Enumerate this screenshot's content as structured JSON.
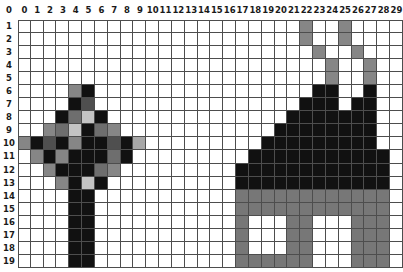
{
  "app": {
    "title": "Pixel Grid Editor",
    "description": "Pixel-art grid showing a tree on the left and a house on the right"
  },
  "grid": {
    "columns": 30,
    "rows": 19,
    "column_labels": [
      "0",
      "1",
      "2",
      "3",
      "4",
      "5",
      "6",
      "7",
      "8",
      "9",
      "10",
      "11",
      "12",
      "13",
      "14",
      "15",
      "16",
      "17",
      "18",
      "19",
      "20",
      "21",
      "22",
      "23",
      "24",
      "25",
      "26",
      "27",
      "28",
      "29"
    ],
    "row_labels": [
      "1",
      "2",
      "3",
      "4",
      "5",
      "6",
      "7",
      "8",
      "9",
      "10",
      "11",
      "12",
      "13",
      "14",
      "15",
      "16",
      "17",
      "18",
      "19"
    ],
    "corner_label": "0",
    "gridline_color": "#4d4d4d",
    "background_color": "#ffffff"
  },
  "palette": {
    "empty": "#ffffff",
    "black": "#111111",
    "dark_gray": "#4f4f4f",
    "mid_gray": "#6e6e6e",
    "gray": "#868686",
    "light_gray": "#a8a8a8",
    "pale_gray": "#c4c4c4",
    "house_body": "#777777",
    "window": "#ffffff"
  },
  "chart_data": {
    "type": "heatmap",
    "xlabel": "column",
    "ylabel": "row",
    "x": [
      "0",
      "1",
      "2",
      "3",
      "4",
      "5",
      "6",
      "7",
      "8",
      "9",
      "10",
      "11",
      "12",
      "13",
      "14",
      "15",
      "16",
      "17",
      "18",
      "19",
      "20",
      "21",
      "22",
      "23",
      "24",
      "25",
      "26",
      "27",
      "28",
      "29"
    ],
    "y": [
      "1",
      "2",
      "3",
      "4",
      "5",
      "6",
      "7",
      "8",
      "9",
      "10",
      "11",
      "12",
      "13",
      "14",
      "15",
      "16",
      "17",
      "18",
      "19"
    ],
    "legend": [
      "empty",
      "black",
      "dark_gray",
      "mid_gray",
      "gray",
      "light_gray",
      "pale_gray",
      "house_body"
    ],
    "cells": [
      [
        "e",
        "e",
        "e",
        "e",
        "e",
        "e",
        "e",
        "e",
        "e",
        "e",
        "e",
        "e",
        "e",
        "e",
        "e",
        "e",
        "e",
        "e",
        "e",
        "e",
        "e",
        "e",
        "g",
        "e",
        "e",
        "g",
        "e",
        "e",
        "e",
        "e"
      ],
      [
        "e",
        "e",
        "e",
        "e",
        "e",
        "e",
        "e",
        "e",
        "e",
        "e",
        "e",
        "e",
        "e",
        "e",
        "e",
        "e",
        "e",
        "e",
        "e",
        "e",
        "e",
        "e",
        "g",
        "e",
        "e",
        "g",
        "e",
        "e",
        "e",
        "e"
      ],
      [
        "e",
        "e",
        "e",
        "e",
        "e",
        "e",
        "e",
        "e",
        "e",
        "e",
        "e",
        "e",
        "e",
        "e",
        "e",
        "e",
        "e",
        "e",
        "e",
        "e",
        "e",
        "e",
        "e",
        "g",
        "e",
        "e",
        "g",
        "e",
        "e",
        "e"
      ],
      [
        "e",
        "e",
        "e",
        "e",
        "e",
        "e",
        "e",
        "e",
        "e",
        "e",
        "e",
        "e",
        "e",
        "e",
        "e",
        "e",
        "e",
        "e",
        "e",
        "e",
        "e",
        "e",
        "e",
        "e",
        "g",
        "e",
        "e",
        "g",
        "e",
        "e"
      ],
      [
        "e",
        "e",
        "e",
        "e",
        "e",
        "e",
        "e",
        "e",
        "e",
        "e",
        "e",
        "e",
        "e",
        "e",
        "e",
        "e",
        "e",
        "e",
        "e",
        "e",
        "e",
        "e",
        "e",
        "e",
        "g",
        "e",
        "e",
        "g",
        "e",
        "e"
      ],
      [
        "e",
        "e",
        "e",
        "e",
        "g",
        "k",
        "e",
        "e",
        "e",
        "e",
        "e",
        "e",
        "e",
        "e",
        "e",
        "e",
        "e",
        "e",
        "e",
        "e",
        "e",
        "e",
        "e",
        "k",
        "k",
        "e",
        "e",
        "k",
        "e",
        "e"
      ],
      [
        "e",
        "e",
        "e",
        "e",
        "k",
        "d",
        "e",
        "e",
        "e",
        "e",
        "e",
        "e",
        "e",
        "e",
        "e",
        "e",
        "e",
        "e",
        "e",
        "e",
        "e",
        "e",
        "k",
        "k",
        "k",
        "e",
        "k",
        "k",
        "e",
        "e"
      ],
      [
        "e",
        "e",
        "e",
        "k",
        "m",
        "p",
        "k",
        "e",
        "e",
        "e",
        "e",
        "e",
        "e",
        "e",
        "e",
        "e",
        "e",
        "e",
        "e",
        "e",
        "e",
        "k",
        "k",
        "k",
        "k",
        "k",
        "k",
        "k",
        "e",
        "e"
      ],
      [
        "e",
        "e",
        "g",
        "m",
        "p",
        "k",
        "m",
        "g",
        "e",
        "e",
        "e",
        "e",
        "e",
        "e",
        "e",
        "e",
        "e",
        "e",
        "e",
        "e",
        "k",
        "k",
        "k",
        "k",
        "k",
        "k",
        "k",
        "k",
        "e",
        "e"
      ],
      [
        "g",
        "k",
        "d",
        "k",
        "g",
        "k",
        "k",
        "d",
        "k",
        "l",
        "e",
        "e",
        "e",
        "e",
        "e",
        "e",
        "e",
        "e",
        "e",
        "k",
        "k",
        "k",
        "k",
        "k",
        "k",
        "k",
        "k",
        "k",
        "e",
        "e"
      ],
      [
        "e",
        "g",
        "k",
        "g",
        "k",
        "k",
        "k",
        "m",
        "k",
        "e",
        "e",
        "e",
        "e",
        "e",
        "e",
        "e",
        "e",
        "e",
        "k",
        "k",
        "k",
        "k",
        "k",
        "k",
        "k",
        "k",
        "k",
        "k",
        "k",
        "e"
      ],
      [
        "e",
        "e",
        "g",
        "k",
        "k",
        "k",
        "m",
        "g",
        "e",
        "e",
        "e",
        "e",
        "e",
        "e",
        "e",
        "e",
        "e",
        "k",
        "k",
        "k",
        "k",
        "k",
        "k",
        "k",
        "k",
        "k",
        "k",
        "k",
        "k",
        "e"
      ],
      [
        "e",
        "e",
        "e",
        "g",
        "k",
        "p",
        "k",
        "e",
        "e",
        "e",
        "e",
        "e",
        "e",
        "e",
        "e",
        "e",
        "e",
        "k",
        "k",
        "k",
        "k",
        "k",
        "k",
        "k",
        "k",
        "k",
        "k",
        "k",
        "k",
        "e"
      ],
      [
        "e",
        "e",
        "e",
        "e",
        "k",
        "k",
        "e",
        "e",
        "e",
        "e",
        "e",
        "e",
        "e",
        "e",
        "e",
        "e",
        "e",
        "h",
        "h",
        "h",
        "h",
        "h",
        "h",
        "h",
        "h",
        "h",
        "h",
        "h",
        "h",
        "e"
      ],
      [
        "e",
        "e",
        "e",
        "e",
        "k",
        "k",
        "e",
        "e",
        "e",
        "e",
        "e",
        "e",
        "e",
        "e",
        "e",
        "e",
        "e",
        "h",
        "h",
        "h",
        "h",
        "h",
        "h",
        "h",
        "h",
        "h",
        "h",
        "h",
        "h",
        "e"
      ],
      [
        "e",
        "e",
        "e",
        "e",
        "k",
        "k",
        "e",
        "e",
        "e",
        "e",
        "e",
        "e",
        "e",
        "e",
        "e",
        "e",
        "e",
        "h",
        "w",
        "w",
        "w",
        "h",
        "h",
        "w",
        "w",
        "w",
        "h",
        "h",
        "h",
        "e"
      ],
      [
        "e",
        "e",
        "e",
        "e",
        "k",
        "k",
        "e",
        "e",
        "e",
        "e",
        "e",
        "e",
        "e",
        "e",
        "e",
        "e",
        "e",
        "h",
        "w",
        "w",
        "w",
        "h",
        "h",
        "w",
        "w",
        "w",
        "h",
        "h",
        "h",
        "e"
      ],
      [
        "e",
        "e",
        "e",
        "e",
        "k",
        "k",
        "e",
        "e",
        "e",
        "e",
        "e",
        "e",
        "e",
        "e",
        "e",
        "e",
        "e",
        "h",
        "w",
        "w",
        "w",
        "h",
        "h",
        "w",
        "w",
        "w",
        "h",
        "h",
        "h",
        "e"
      ],
      [
        "e",
        "e",
        "e",
        "e",
        "k",
        "k",
        "e",
        "e",
        "e",
        "e",
        "e",
        "e",
        "e",
        "e",
        "e",
        "e",
        "e",
        "h",
        "h",
        "h",
        "h",
        "h",
        "h",
        "w",
        "w",
        "w",
        "h",
        "h",
        "h",
        "e"
      ]
    ],
    "legend_map": {
      "e": "#ffffff",
      "k": "#111111",
      "d": "#4f4f4f",
      "m": "#6e6e6e",
      "g": "#868686",
      "l": "#a8a8a8",
      "p": "#c4c4c4",
      "h": "#777777",
      "w": "#ffffff"
    }
  }
}
